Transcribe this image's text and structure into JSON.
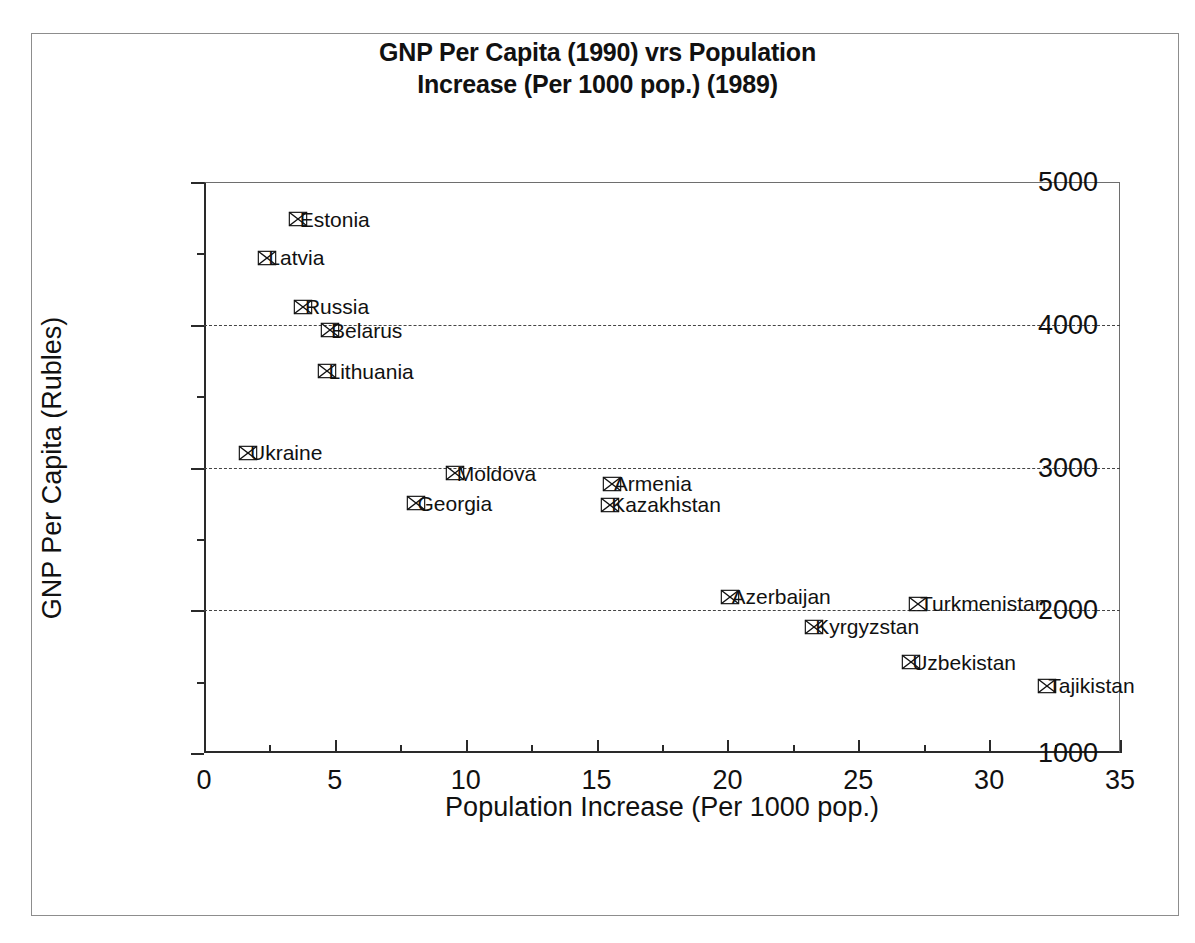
{
  "chart_data": {
    "type": "scatter",
    "title": "GNP Per Capita (1990) vrs Population Increase (Per 1000 pop.) (1989)",
    "title_lines": [
      "GNP Per Capita (1990) vrs Population",
      "Increase (Per 1000 pop.) (1989)"
    ],
    "xlabel": "Population Increase (Per 1000 pop.)",
    "ylabel": "GNP Per Capita (Rubles)",
    "xlim": [
      0,
      35
    ],
    "ylim": [
      1000,
      5000
    ],
    "xticks": [
      0,
      5,
      10,
      15,
      20,
      25,
      30,
      35
    ],
    "xtick_labels": [
      "0",
      "5",
      "10",
      "15",
      "20",
      "25",
      "30",
      "35"
    ],
    "xminor_ticks": [
      2.5,
      7.5,
      12.5,
      17.5,
      22.5,
      27.5,
      32.5
    ],
    "yticks": [
      1000,
      2000,
      3000,
      4000,
      5000
    ],
    "ytick_labels": [
      "1000",
      "2000",
      "3000",
      "4000",
      "5000"
    ],
    "yminor_ticks": [
      1500,
      2500,
      3500,
      4500
    ],
    "gridlines_y": [
      2000,
      3000,
      4000
    ],
    "grid": "horizontal-dashed",
    "legend": "none",
    "marker": "crossed-rectangle",
    "marker_color": "#111111",
    "points": [
      {
        "label": "Estonia",
        "x": 3.6,
        "y": 4740,
        "label_side": "right"
      },
      {
        "label": "Latvia",
        "x": 2.4,
        "y": 4470,
        "label_side": "right"
      },
      {
        "label": "Russia",
        "x": 3.8,
        "y": 4125,
        "label_side": "right"
      },
      {
        "label": "Belarus",
        "x": 4.8,
        "y": 3960,
        "label_side": "right"
      },
      {
        "label": "Lithuania",
        "x": 4.7,
        "y": 3675,
        "label_side": "right"
      },
      {
        "label": "Ukraine",
        "x": 1.7,
        "y": 3105,
        "label_side": "right"
      },
      {
        "label": "Moldova",
        "x": 9.6,
        "y": 2960,
        "label_side": "right"
      },
      {
        "label": "Georgia",
        "x": 8.1,
        "y": 2750,
        "label_side": "right"
      },
      {
        "label": "Armenia",
        "x": 15.6,
        "y": 2885,
        "label_side": "right"
      },
      {
        "label": "Kazakhstan",
        "x": 15.5,
        "y": 2740,
        "label_side": "right"
      },
      {
        "label": "Azerbaijan",
        "x": 20.1,
        "y": 2095,
        "label_side": "right"
      },
      {
        "label": "Turkmenistan",
        "x": 27.3,
        "y": 2045,
        "label_side": "right"
      },
      {
        "label": "Kyrgyzstan",
        "x": 23.3,
        "y": 1885,
        "label_side": "right"
      },
      {
        "label": "Uzbekistan",
        "x": 27.0,
        "y": 1635,
        "label_side": "right"
      },
      {
        "label": "Tajikistan",
        "x": 32.2,
        "y": 1470,
        "label_side": "right"
      }
    ]
  }
}
